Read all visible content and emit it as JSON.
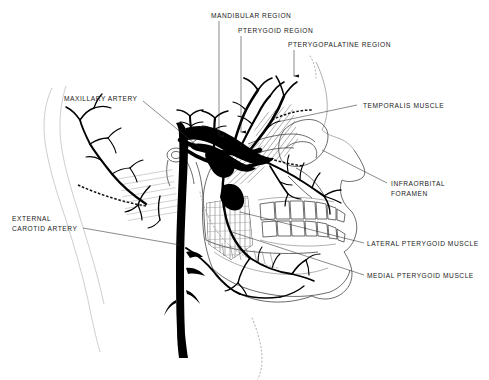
{
  "figure": {
    "background_color": "#ffffff",
    "ink_color": "#000000",
    "text_color": "#1a1a1a",
    "width": 489,
    "height": 380
  },
  "labels": {
    "mandibular_region": "MANDIBULAR REGION",
    "pterygoid_region": "PTERYGOID REGION",
    "pterygopalatine_region": "PTERYGOPALATINE REGION",
    "maxillary_artery": "MAXILLARY ARTERY",
    "external_carotid_artery_line1": "EXTERNAL",
    "external_carotid_artery_line2": "CAROTID ARTERY",
    "temporalis_muscle": "TEMPORALIS MUSCLE",
    "infraorbital_foramen_line1": "INFRAORBITAL",
    "infraorbital_foramen_line2": "FORAMEN",
    "lateral_pterygoid_muscle": "LATERAL PTERYGOID MUSCLE",
    "medial_pterygoid_muscle": "MEDIAL PTERYGOID MUSCLE"
  },
  "structures": {
    "skull_profile": "lateral-skull-outline",
    "mandible": "mandible-outline",
    "maxillary_teeth": "upper-dental-arch",
    "mandibular_teeth": "lower-dental-arch",
    "orbit": "orbital-rim",
    "zygomatic_arch": "zygomatic-arch",
    "external_carotid_trunk": "external-carotid-artery-trunk",
    "superficial_temporal": "superficial-temporal-artery",
    "maxillary_artery_course": "maxillary-artery-course",
    "inferior_alveolar": "inferior-alveolar-artery",
    "infraorbital_artery": "infraorbital-artery",
    "medial_pterygoid_hatch": "medial-pterygoid-muscle-hatching",
    "lateral_pterygoid_hatch": "lateral-pterygoid-muscle-hatching",
    "temporalis_hatch": "temporalis-muscle-hatching",
    "soft_tissue_profile": "soft-tissue-face-profile"
  },
  "arrows": {
    "count": 3,
    "direction": "down",
    "targets": [
      "mandibular-region",
      "pterygoid-region",
      "pterygopalatine-region"
    ]
  }
}
